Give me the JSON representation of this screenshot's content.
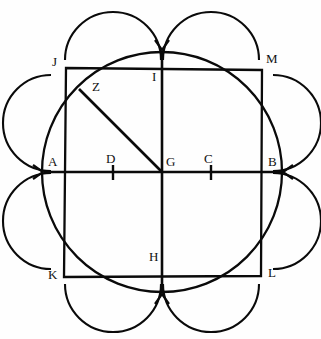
{
  "figure": {
    "canvas": {
      "width": 321,
      "height": 339,
      "background": "#ffffff"
    },
    "stroke_color": "#0a0a0a"
  },
  "geometry": {
    "center": {
      "name": "G",
      "x": 162,
      "y": 172
    },
    "main_circle": {
      "cx": 162,
      "cy": 172,
      "r": 120
    },
    "square": {
      "top_left": {
        "name": "J",
        "x": 66,
        "y": 68
      },
      "top_right": {
        "name": "M",
        "x": 262,
        "y": 70
      },
      "bottom_right": {
        "name": "L",
        "x": 261,
        "y": 276
      },
      "bottom_left": {
        "name": "K",
        "x": 64,
        "y": 277
      }
    },
    "horizontal_diameter": {
      "from": "A",
      "to": "B",
      "y": 172,
      "x1": 44,
      "x2": 282
    },
    "vertical_diameter": {
      "from": "I",
      "to": "H",
      "x": 162,
      "y1": 52,
      "y2": 292
    },
    "chord": {
      "from": "Z",
      "to": "G",
      "x1": 80,
      "y1": 90,
      "x2": 162,
      "y2": 172
    },
    "ticks": [
      {
        "label": "D",
        "x": 113,
        "y": 172
      },
      {
        "label": "C",
        "x": 211,
        "y": 172
      }
    ],
    "petals": [
      {
        "name": "petal-top-left",
        "cx": 113,
        "cy": 60,
        "r": 48
      },
      {
        "name": "petal-top-right",
        "cx": 211,
        "cy": 60,
        "r": 48
      },
      {
        "name": "petal-right-top",
        "cx": 273,
        "cy": 123,
        "r": 48
      },
      {
        "name": "petal-right-bottom",
        "cx": 273,
        "cy": 221,
        "r": 48
      },
      {
        "name": "petal-bottom-right",
        "cx": 211,
        "cy": 284,
        "r": 48
      },
      {
        "name": "petal-bottom-left",
        "cx": 113,
        "cy": 284,
        "r": 48
      },
      {
        "name": "petal-left-bottom",
        "cx": 51,
        "cy": 221,
        "r": 48
      },
      {
        "name": "petal-left-top",
        "cx": 51,
        "cy": 123,
        "r": 48
      }
    ],
    "arrowheads": [
      {
        "name": "arrow-top",
        "x": 162,
        "y": 52,
        "direction": "down"
      },
      {
        "name": "arrow-bottom",
        "x": 162,
        "y": 292,
        "direction": "up"
      },
      {
        "name": "arrow-left",
        "x": 44,
        "y": 172,
        "direction": "right"
      },
      {
        "name": "arrow-right",
        "x": 282,
        "y": 172,
        "direction": "left"
      }
    ]
  },
  "labels": [
    {
      "id": "J",
      "text": "J",
      "x": 52,
      "y": 55
    },
    {
      "id": "M",
      "text": "M",
      "x": 266,
      "y": 52
    },
    {
      "id": "Z",
      "text": "Z",
      "x": 92,
      "y": 80
    },
    {
      "id": "I",
      "text": "I",
      "x": 152,
      "y": 70
    },
    {
      "id": "A",
      "text": "A",
      "x": 48,
      "y": 155
    },
    {
      "id": "D",
      "text": "D",
      "x": 106,
      "y": 152
    },
    {
      "id": "G",
      "text": "G",
      "x": 166,
      "y": 155
    },
    {
      "id": "C",
      "text": "C",
      "x": 204,
      "y": 152
    },
    {
      "id": "B",
      "text": "B",
      "x": 268,
      "y": 155
    },
    {
      "id": "K",
      "text": "K",
      "x": 48,
      "y": 268
    },
    {
      "id": "H",
      "text": "H",
      "x": 149,
      "y": 250
    },
    {
      "id": "L",
      "text": "L",
      "x": 268,
      "y": 266
    }
  ]
}
